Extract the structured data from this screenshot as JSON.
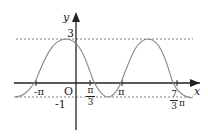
{
  "diagram": {
    "type": "function-graph",
    "axis_labels": {
      "x": "x",
      "y": "y",
      "origin": "O"
    },
    "y_ticks": {
      "max": "3",
      "min": "-1"
    },
    "x_ticks": [
      {
        "label": "-π"
      },
      {
        "num": "π",
        "den": "3"
      },
      {
        "label": "π"
      },
      {
        "num": "7",
        "den": "3",
        "suffix": "π"
      }
    ],
    "curve": "sinusoid oscillating between -1 and 3",
    "colors": {
      "axis": "#222222",
      "curve": "#888888",
      "dashed": "#666666"
    }
  }
}
